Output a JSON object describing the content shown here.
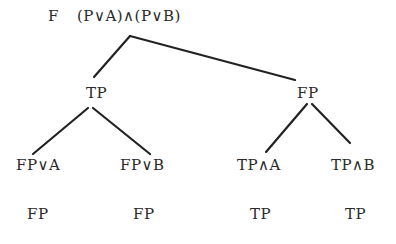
{
  "diagram": {
    "type": "truth-tree",
    "root": {
      "prefix": "F",
      "formula": "(P∨A)∧(P∨B)"
    },
    "level1": {
      "left": "TP",
      "right": "FP"
    },
    "level2": {
      "left_left": "FP∨A",
      "left_right": "FP∨B",
      "right_left": "TP∧A",
      "right_right": "TP∧B"
    },
    "level3": {
      "left_left": "FP",
      "left_right": "FP",
      "right_left": "TP",
      "right_right": "TP"
    },
    "colors": {
      "ink": "#2a2a2a",
      "background": "#ffffff"
    }
  }
}
